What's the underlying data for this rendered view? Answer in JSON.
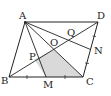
{
  "diagram": {
    "type": "geometry",
    "points": {
      "A": {
        "label": "A",
        "x": 25,
        "y": 22
      },
      "B": {
        "label": "B",
        "x": 9,
        "y": 77
      },
      "C": {
        "label": "C",
        "x": 83,
        "y": 77
      },
      "D": {
        "label": "D",
        "x": 98,
        "y": 22
      },
      "O": {
        "label": "O",
        "x": 54,
        "y": 49.5
      },
      "M": {
        "label": "M",
        "x": 46,
        "y": 77
      },
      "N": {
        "label": "N",
        "x": 90.5,
        "y": 49.5
      },
      "P": {
        "label": "P",
        "x": 34.5,
        "y": 59.5
      },
      "Q": {
        "label": "Q",
        "x": 73.5,
        "y": 39.5
      }
    },
    "shaded_region": [
      "P",
      "O",
      "C",
      "M"
    ],
    "colors": {
      "line": "#222222",
      "shade": "#d9d9d9"
    }
  }
}
